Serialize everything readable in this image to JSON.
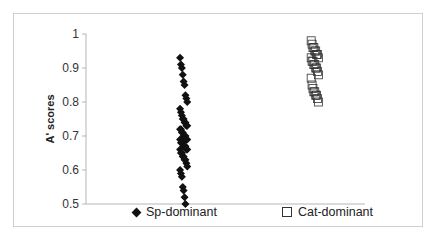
{
  "chart_data": {
    "type": "scatter",
    "title": "",
    "xlabel": "",
    "ylabel": "A' scores",
    "ylim": [
      0.5,
      1.0
    ],
    "yticks": [
      "1",
      "0.9",
      "0.8",
      "0.7",
      "0.6",
      "0.5"
    ],
    "grid": false,
    "legend_position": "bottom",
    "series": [
      {
        "name": "Sp-dominant",
        "marker": "diamond",
        "color": "#111111",
        "x_center": 0.35,
        "values": [
          0.93,
          0.91,
          0.9,
          0.88,
          0.86,
          0.85,
          0.82,
          0.81,
          0.8,
          0.78,
          0.77,
          0.76,
          0.75,
          0.75,
          0.74,
          0.74,
          0.73,
          0.73,
          0.72,
          0.72,
          0.71,
          0.71,
          0.7,
          0.7,
          0.7,
          0.69,
          0.69,
          0.69,
          0.68,
          0.68,
          0.68,
          0.67,
          0.67,
          0.67,
          0.66,
          0.66,
          0.66,
          0.65,
          0.65,
          0.64,
          0.64,
          0.63,
          0.63,
          0.62,
          0.61,
          0.6,
          0.59,
          0.58,
          0.55,
          0.54,
          0.52,
          0.5
        ]
      },
      {
        "name": "Cat-dominant",
        "marker": "square-open",
        "color": "#333333",
        "x_center": 0.82,
        "values": [
          0.98,
          0.97,
          0.96,
          0.96,
          0.95,
          0.95,
          0.94,
          0.94,
          0.93,
          0.93,
          0.92,
          0.92,
          0.91,
          0.91,
          0.9,
          0.9,
          0.89,
          0.88,
          0.87,
          0.85,
          0.84,
          0.83,
          0.83,
          0.82,
          0.82,
          0.81,
          0.8
        ]
      }
    ]
  },
  "legend": {
    "sp_label": "Sp-dominant",
    "cat_label": "Cat-dominant"
  }
}
